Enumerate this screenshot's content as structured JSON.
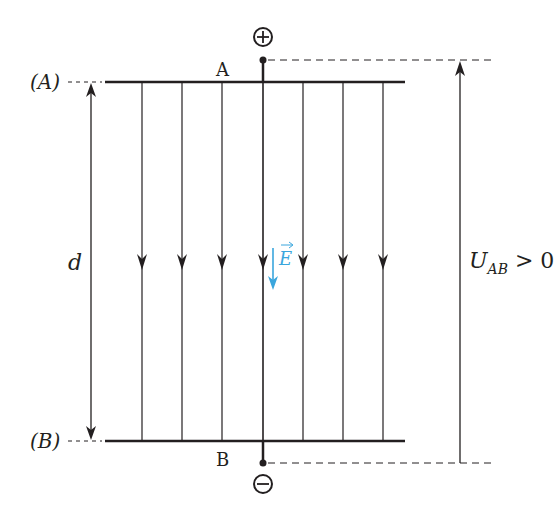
{
  "diagram": {
    "labels": {
      "plate_a_side": "(A)",
      "plate_b_side": "(B)",
      "plate_a": "A",
      "plate_b": "B",
      "distance": "d",
      "field": "E",
      "voltage_main": "U",
      "voltage_sub": "AB",
      "voltage_rel": " > 0"
    },
    "terminals": {
      "positive": "+",
      "negative": "−"
    },
    "field_lines_x": [
      142,
      182,
      222,
      263,
      303,
      343,
      383
    ],
    "colors": {
      "ink": "#231f20",
      "field_vector": "#3aa6dd"
    }
  }
}
